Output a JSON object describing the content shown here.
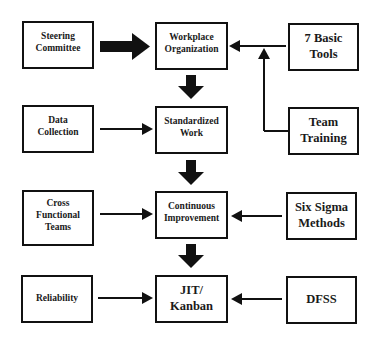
{
  "diagram": {
    "left_column": [
      {
        "id": "steering",
        "label": "Steering\nCommittee"
      },
      {
        "id": "data",
        "label": "Data\nCollection"
      },
      {
        "id": "cross",
        "label": "Cross\nFunctional\nTeams"
      },
      {
        "id": "reliability",
        "label": "Reliability"
      }
    ],
    "center_column": [
      {
        "id": "workplace",
        "label": "Workplace\nOrganization"
      },
      {
        "id": "standardized",
        "label": "Standardized\nWork"
      },
      {
        "id": "continuous",
        "label": "Continuous\nImprovement"
      },
      {
        "id": "jit",
        "label": "JIT/\nKanban"
      }
    ],
    "right_column": [
      {
        "id": "tools",
        "label": "7 Basic\nTools"
      },
      {
        "id": "training",
        "label": "Team\nTraining"
      },
      {
        "id": "sixsigma",
        "label": "Six Sigma\nMethods"
      },
      {
        "id": "dfss",
        "label": "DFSS"
      }
    ],
    "edges": [
      {
        "from": "steering",
        "to": "workplace",
        "style": "thick"
      },
      {
        "from": "tools",
        "to": "workplace",
        "style": "thin"
      },
      {
        "from": "training",
        "to": "workplace",
        "style": "thin-elbow"
      },
      {
        "from": "workplace",
        "to": "standardized",
        "style": "thick"
      },
      {
        "from": "data",
        "to": "standardized",
        "style": "thin"
      },
      {
        "from": "standardized",
        "to": "continuous",
        "style": "thick"
      },
      {
        "from": "cross",
        "to": "continuous",
        "style": "thin"
      },
      {
        "from": "sixsigma",
        "to": "continuous",
        "style": "thin"
      },
      {
        "from": "continuous",
        "to": "jit",
        "style": "thick"
      },
      {
        "from": "reliability",
        "to": "jit",
        "style": "thin"
      },
      {
        "from": "dfss",
        "to": "jit",
        "style": "thin"
      }
    ]
  },
  "labels": {
    "steering_1": "Steering",
    "steering_2": "Committee",
    "data_1": "Data",
    "data_2": "Collection",
    "cross_1": "Cross",
    "cross_2": "Functional",
    "cross_3": "Teams",
    "reliability": "Reliability",
    "workplace_1": "Workplace",
    "workplace_2": "Organization",
    "standardized_1": "Standardized",
    "standardized_2": "Work",
    "continuous_1": "Continuous",
    "continuous_2": "Improvement",
    "jit_1": "JIT/",
    "jit_2": "Kanban",
    "tools_1": "7 Basic",
    "tools_2": "Tools",
    "training_1": "Team",
    "training_2": "Training",
    "sixsigma_1": "Six Sigma",
    "sixsigma_2": "Methods",
    "dfss": "DFSS"
  },
  "colors": {
    "line": "#111111",
    "background": "#ffffff"
  }
}
